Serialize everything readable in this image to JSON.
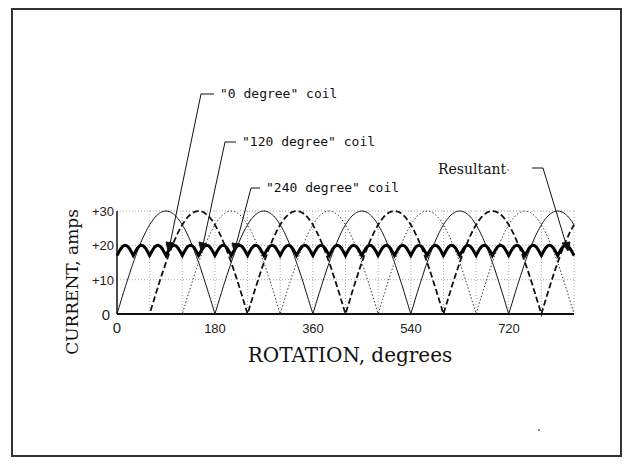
{
  "chart_data": {
    "type": "line",
    "title": "",
    "xlabel": "ROTATION, degrees",
    "ylabel": "CURRENT, amps",
    "xlim": [
      0,
      840
    ],
    "ylim": [
      0,
      30
    ],
    "xticks": [
      0,
      180,
      360,
      540,
      720
    ],
    "xtick_labels": [
      "0",
      "180",
      "360",
      "540",
      "720"
    ],
    "yticks": [
      0,
      10,
      20,
      30
    ],
    "ytick_labels": [
      "0",
      "+10",
      "+20",
      "+30"
    ],
    "grid": true,
    "grid_x_step": 60,
    "legend": "annotations",
    "series": [
      {
        "name": "\"0 degree\" coil",
        "style": "solid",
        "function": "30*|sin(x)|",
        "phase_deg": 0,
        "peak": 30,
        "zeros_at": [
          0,
          180,
          360,
          540,
          720
        ]
      },
      {
        "name": "\"120 degree\" coil",
        "style": "dashed",
        "function": "30*|sin(x-60)|",
        "phase_deg": 60,
        "peak": 30,
        "zeros_at": [
          60,
          240,
          420,
          600,
          780
        ]
      },
      {
        "name": "\"240 degree\" coil",
        "style": "dotted",
        "function": "30*|sin(x-120)|",
        "phase_deg": 120,
        "peak": 30,
        "zeros_at": [
          120,
          300,
          480,
          660,
          840
        ]
      },
      {
        "name": "Resultant",
        "style": "thick-solid",
        "approx_min": 17,
        "approx_max": 20,
        "ripple_period_deg": 30
      }
    ],
    "annotations": [
      {
        "text": "\"0 degree\" coil",
        "points_to_x": 90,
        "points_to_y": 30
      },
      {
        "text": "\"120 degree\" coil",
        "points_to_x": 150,
        "points_to_y": 30
      },
      {
        "text": "\"240 degree\" coil",
        "points_to_x": 210,
        "points_to_y": 30
      },
      {
        "text": "Resultant",
        "points_to_x": 810,
        "points_to_y": 20
      }
    ]
  },
  "labels": {
    "ylabel": "CURRENT, amps",
    "xlabel": "ROTATION, degrees",
    "ann0": "\"0 degree\" coil",
    "ann120": "\"120 degree\" coil",
    "ann240": "\"240 degree\" coil",
    "annRes": "Resultant",
    "y0": "0",
    "y10": "+10",
    "y20": "+20",
    "y30": "+30",
    "x0": "0",
    "x180": "180",
    "x360": "360",
    "x540": "540",
    "x720": "720"
  }
}
